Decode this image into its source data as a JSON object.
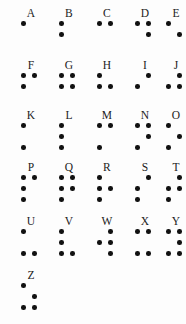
{
  "chart": {
    "dot_color": "#111111",
    "letter_color": "#1b1b1b",
    "background_color": "#fdfdfd",
    "columns": 5,
    "rows": 6,
    "dot_numbering": "1=top-left, 2=middle-left, 3=bottom-left, 4=top-right, 5=middle-right, 6=bottom-right",
    "letters": [
      {
        "label": "A",
        "dots": [
          1
        ],
        "row": 0,
        "col": 0
      },
      {
        "label": "B",
        "dots": [
          1,
          2
        ],
        "row": 0,
        "col": 1
      },
      {
        "label": "C",
        "dots": [
          1,
          4
        ],
        "row": 0,
        "col": 2
      },
      {
        "label": "D",
        "dots": [
          1,
          4,
          5
        ],
        "row": 0,
        "col": 3
      },
      {
        "label": "E",
        "dots": [
          1,
          5
        ],
        "row": 0,
        "col": 4
      },
      {
        "label": "F",
        "dots": [
          1,
          2,
          4
        ],
        "row": 1,
        "col": 0
      },
      {
        "label": "G",
        "dots": [
          1,
          2,
          4,
          5
        ],
        "row": 1,
        "col": 1
      },
      {
        "label": "H",
        "dots": [
          1,
          2,
          5
        ],
        "row": 1,
        "col": 2
      },
      {
        "label": "I",
        "dots": [
          2,
          4
        ],
        "row": 1,
        "col": 3
      },
      {
        "label": "J",
        "dots": [
          2,
          4,
          5
        ],
        "row": 1,
        "col": 4
      },
      {
        "label": "K",
        "dots": [
          1,
          3
        ],
        "row": 2,
        "col": 0
      },
      {
        "label": "L",
        "dots": [
          1,
          2,
          3
        ],
        "row": 2,
        "col": 1
      },
      {
        "label": "M",
        "dots": [
          1,
          3,
          4
        ],
        "row": 2,
        "col": 2
      },
      {
        "label": "N",
        "dots": [
          1,
          3,
          4,
          5
        ],
        "row": 2,
        "col": 3
      },
      {
        "label": "O",
        "dots": [
          1,
          3,
          5
        ],
        "row": 2,
        "col": 4
      },
      {
        "label": "P",
        "dots": [
          1,
          2,
          3,
          4
        ],
        "row": 3,
        "col": 0
      },
      {
        "label": "Q",
        "dots": [
          1,
          2,
          3,
          4,
          5
        ],
        "row": 3,
        "col": 1
      },
      {
        "label": "R",
        "dots": [
          1,
          2,
          3,
          5
        ],
        "row": 3,
        "col": 2
      },
      {
        "label": "S",
        "dots": [
          2,
          3,
          4
        ],
        "row": 3,
        "col": 3
      },
      {
        "label": "T",
        "dots": [
          2,
          3,
          4,
          5
        ],
        "row": 3,
        "col": 4
      },
      {
        "label": "U",
        "dots": [
          1,
          3,
          6
        ],
        "row": 4,
        "col": 0
      },
      {
        "label": "V",
        "dots": [
          1,
          2,
          3,
          6
        ],
        "row": 4,
        "col": 1
      },
      {
        "label": "W",
        "dots": [
          2,
          4,
          5,
          6
        ],
        "row": 4,
        "col": 2
      },
      {
        "label": "X",
        "dots": [
          1,
          3,
          4,
          6
        ],
        "row": 4,
        "col": 3
      },
      {
        "label": "Y",
        "dots": [
          1,
          3,
          4,
          5,
          6
        ],
        "row": 4,
        "col": 4
      },
      {
        "label": "Z",
        "dots": [
          1,
          3,
          5,
          6
        ],
        "row": 5,
        "col": 0
      }
    ]
  },
  "layout": {
    "col_x": [
      14,
      52,
      90,
      128,
      159
    ],
    "row_y": [
      6,
      58,
      108,
      160,
      214,
      268
    ]
  }
}
